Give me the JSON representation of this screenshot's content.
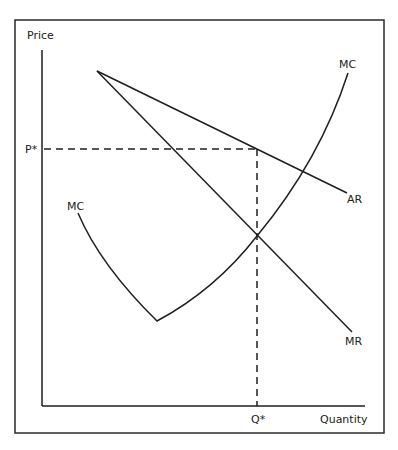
{
  "diagram": {
    "type": "monopoly profit maximization",
    "axes": {
      "y_label": "Price",
      "x_label": "Quantity"
    },
    "markers": {
      "price": "P*",
      "quantity": "Q*"
    },
    "curves": {
      "ar_label": "AR",
      "mr_label": "MR",
      "mc_label_top": "MC",
      "mc_label_left": "MC"
    },
    "colors": {
      "line": "#1f1f1f",
      "frame": "#2a2a2a",
      "background": "#ffffff"
    }
  }
}
